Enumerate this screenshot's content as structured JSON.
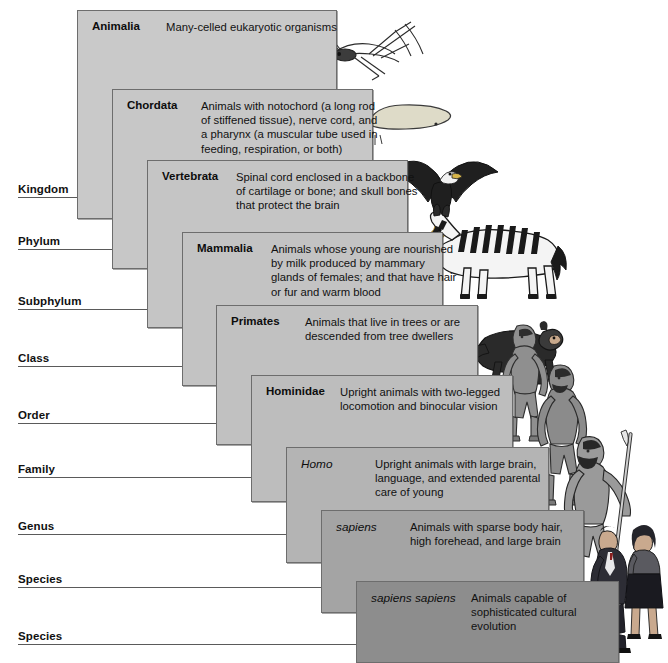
{
  "figure": {
    "card_border_color": "#6d6d6d",
    "background_color": "#ffffff",
    "rank_line_color": "#5a5a5a"
  },
  "ranks": [
    {
      "label": "Kingdom",
      "y": 198,
      "line_end": 77
    },
    {
      "label": "Phylum",
      "y": 250,
      "line_end": 112
    },
    {
      "label": "Subphylum",
      "y": 310,
      "line_end": 147
    },
    {
      "label": "Class",
      "y": 367,
      "line_end": 182
    },
    {
      "label": "Order",
      "y": 424,
      "line_end": 216
    },
    {
      "label": "Family",
      "y": 478,
      "line_end": 251
    },
    {
      "label": "Genus",
      "y": 535,
      "line_end": 286
    },
    {
      "label": "Species",
      "y": 588,
      "line_end": 321
    },
    {
      "label": "Species",
      "y": 645,
      "line_end": 356
    }
  ],
  "cards": [
    {
      "taxon": "Animalia",
      "italic": false,
      "description": [
        "Many-celled eukaryotic organisms"
      ],
      "x": 77,
      "y": 10,
      "width": 260,
      "height": 209,
      "taxon_width": 74,
      "fill": "#c9c9c9"
    },
    {
      "taxon": "Chordata",
      "italic": false,
      "description": [
        "Animals with notochord (a long rod",
        "of stiffened tissue), nerve cord, and",
        "a pharynx (a muscular tube used in",
        "feeding, respiration, or both)"
      ],
      "x": 112,
      "y": 89,
      "width": 261,
      "height": 180,
      "taxon_width": 74,
      "fill": "#c7c7c7"
    },
    {
      "taxon": "Vertebrata",
      "italic": false,
      "description": [
        "Spinal cord enclosed in a backbone",
        "of cartilage or bone; and skull bones",
        "that protect the brain"
      ],
      "x": 147,
      "y": 160,
      "width": 261,
      "height": 168,
      "taxon_width": 74,
      "fill": "#c5c5c5"
    },
    {
      "taxon": "Mammalia",
      "italic": false,
      "description": [
        "Animals whose young are nourished",
        "by milk produced by mammary",
        "glands of females; and that have hair",
        "or fur and warm blood"
      ],
      "x": 182,
      "y": 232,
      "width": 261,
      "height": 154,
      "taxon_width": 74,
      "fill": "#c3c3c3"
    },
    {
      "taxon": "Primates",
      "italic": false,
      "description": [
        "Animals that live in trees or are",
        "descended from tree dwellers"
      ],
      "x": 216,
      "y": 305,
      "width": 262,
      "height": 140,
      "taxon_width": 74,
      "fill": "#c1c1c1"
    },
    {
      "taxon": "Hominidae",
      "italic": false,
      "description": [
        "Upright animals with two-legged",
        "locomotion and binocular vision"
      ],
      "x": 251,
      "y": 375,
      "width": 262,
      "height": 127,
      "taxon_width": 74,
      "fill": "#bdbdbd"
    },
    {
      "taxon": "Homo",
      "italic": true,
      "description": [
        "Upright animals with large brain,",
        "language, and extended parental",
        "care of young"
      ],
      "x": 286,
      "y": 447,
      "width": 263,
      "height": 116,
      "taxon_width": 74,
      "fill": "#b4b4b4"
    },
    {
      "taxon": "sapiens",
      "italic": true,
      "description": [
        "Animals with sparse body hair,",
        "high forehead, and large brain"
      ],
      "x": 321,
      "y": 510,
      "width": 263,
      "height": 103,
      "taxon_width": 74,
      "fill": "#a4a4a4"
    },
    {
      "taxon": "sapiens sapiens",
      "italic": true,
      "description": [
        "Animals capable of",
        "sophisticated cultural",
        "evolution"
      ],
      "x": 356,
      "y": 581,
      "width": 263,
      "height": 82,
      "taxon_width": 100,
      "fill": "#8d8d8d"
    }
  ],
  "illustrations": [
    {
      "name": "grasshopper-illustration",
      "rank": "Animalia"
    },
    {
      "name": "lancelet-illustration",
      "rank": "Chordata"
    },
    {
      "name": "eagle-illustration",
      "rank": "Vertebrata"
    },
    {
      "name": "zebra-illustration",
      "rank": "Mammalia"
    },
    {
      "name": "monkey-illustration",
      "rank": "Primates"
    },
    {
      "name": "early-hominid-illustration",
      "rank": "Hominidae"
    },
    {
      "name": "homo-erectus-illustration",
      "rank": "Homo"
    },
    {
      "name": "archaic-human-illustration",
      "rank": "sapiens"
    },
    {
      "name": "modern-humans-illustration",
      "rank": "sapiens sapiens"
    }
  ]
}
